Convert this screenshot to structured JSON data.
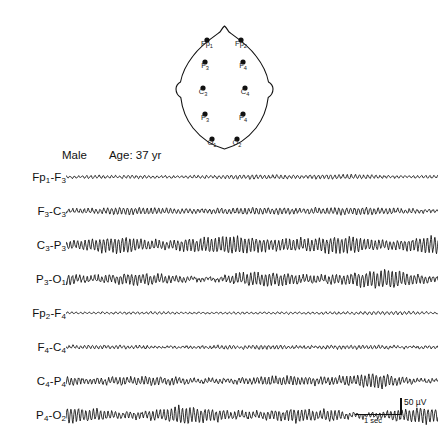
{
  "subject": {
    "sex": "Male",
    "age": "Age: 37 yr"
  },
  "head_map": {
    "name": "eeg-electrode-head-diagram",
    "electrodes": [
      {
        "id": "Fp1",
        "base": "Fp",
        "sub": "1",
        "x": 47,
        "y": 28
      },
      {
        "id": "Fp2",
        "base": "Fp",
        "sub": "2",
        "x": 81,
        "y": 28
      },
      {
        "id": "F3",
        "base": "F",
        "sub": "3",
        "x": 45,
        "y": 50
      },
      {
        "id": "F4",
        "base": "F",
        "sub": "4",
        "x": 83,
        "y": 50
      },
      {
        "id": "C3",
        "base": "C",
        "sub": "3",
        "x": 43,
        "y": 76
      },
      {
        "id": "C4",
        "base": "C",
        "sub": "4",
        "x": 85,
        "y": 76
      },
      {
        "id": "P3",
        "base": "P",
        "sub": "3",
        "x": 45,
        "y": 102
      },
      {
        "id": "P4",
        "base": "P",
        "sub": "4",
        "x": 83,
        "y": 102
      },
      {
        "id": "O1",
        "base": "O",
        "sub": "1",
        "x": 52,
        "y": 127
      },
      {
        "id": "O2",
        "base": "O",
        "sub": "2",
        "x": 77,
        "y": 127
      }
    ]
  },
  "calibration": {
    "amplitude_label": "50 µV",
    "time_label": "1 sec",
    "amplitude_uv": 50,
    "duration_sec": 1
  },
  "chart_data": {
    "type": "line",
    "title": "",
    "xlabel": "1 sec",
    "ylabel": "50 µV",
    "grid": false,
    "legend": "none",
    "recording": "EEG longitudinal bipolar montage, 8 channels",
    "duration_sec": 10,
    "channels": [
      {
        "label": "Fp1-F3",
        "base_left": "Fp",
        "sub_left": "1",
        "base_right": "F",
        "sub_right": "3",
        "amplitude_uv": 10,
        "dominant_freq_hz": 9,
        "seed": 11,
        "roughness": 0.55,
        "burst": 0.15
      },
      {
        "label": "F3-C3",
        "base_left": "F",
        "sub_left": "3",
        "base_right": "C",
        "sub_right": "3",
        "amplitude_uv": 16,
        "dominant_freq_hz": 9.5,
        "seed": 23,
        "roughness": 0.6,
        "burst": 0.2
      },
      {
        "label": "C3-P3",
        "base_left": "C",
        "sub_left": "3",
        "base_right": "P",
        "sub_right": "3",
        "amplitude_uv": 34,
        "dominant_freq_hz": 10,
        "seed": 37,
        "roughness": 0.35,
        "burst": 0.3
      },
      {
        "label": "P3-O1",
        "base_left": "P",
        "sub_left": "3",
        "base_right": "O",
        "sub_right": "1",
        "amplitude_uv": 44,
        "dominant_freq_hz": 10,
        "seed": 41,
        "roughness": 0.3,
        "burst": 0.45
      },
      {
        "label": "Fp2-F4",
        "base_left": "Fp",
        "sub_left": "2",
        "base_right": "F",
        "sub_right": "4",
        "amplitude_uv": 7,
        "dominant_freq_hz": 8.5,
        "seed": 53,
        "roughness": 0.6,
        "burst": 0.1
      },
      {
        "label": "F4-C4",
        "base_left": "F",
        "sub_left": "4",
        "base_right": "C",
        "sub_right": "4",
        "amplitude_uv": 14,
        "dominant_freq_hz": 9.5,
        "seed": 67,
        "roughness": 0.55,
        "burst": 0.2
      },
      {
        "label": "C4-P4",
        "base_left": "C",
        "sub_left": "4",
        "base_right": "P",
        "sub_right": "4",
        "amplitude_uv": 38,
        "dominant_freq_hz": 10,
        "seed": 79,
        "roughness": 0.3,
        "burst": 0.35
      },
      {
        "label": "P4-O2",
        "base_left": "P",
        "sub_left": "4",
        "base_right": "O",
        "sub_right": "2",
        "amplitude_uv": 42,
        "dominant_freq_hz": 10,
        "seed": 89,
        "roughness": 0.3,
        "burst": 0.4
      }
    ]
  }
}
